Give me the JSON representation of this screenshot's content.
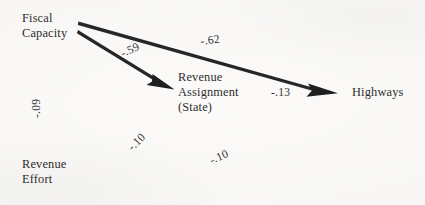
{
  "diagram": {
    "type": "path-diagram",
    "background_color": "#fbfaf8",
    "stroke_color": "#262626",
    "nodes": [
      {
        "id": "fiscal_capacity",
        "label_line1": "Fiscal",
        "label_line2": "Capacity"
      },
      {
        "id": "revenue_assignment",
        "label_line1": "Revenue",
        "label_line2": "Assignment",
        "label_line3": "(State)"
      },
      {
        "id": "highways",
        "label_line1": "Highways"
      },
      {
        "id": "revenue_effort",
        "label_line1": "Revenue",
        "label_line2": "Effort"
      }
    ],
    "coefficients": [
      {
        "id": "fiscal_to_highways",
        "value": "-.62"
      },
      {
        "id": "fiscal_to_revenue_assignment",
        "value": "-.59"
      },
      {
        "id": "revenue_assignment_to_highways",
        "value": "-.13"
      },
      {
        "id": "fiscal_to_revenue_effort",
        "value": "-.09"
      },
      {
        "id": "revenue_effort_to_revenue_assignment",
        "value": "-.10"
      },
      {
        "id": "revenue_effort_to_highways",
        "value": "-.10"
      }
    ],
    "arrows": [
      {
        "id": "arrow-fiscal-to-highways",
        "from": "fiscal_capacity",
        "to": "highways"
      },
      {
        "id": "arrow-fiscal-to-revenue-assignment",
        "from": "fiscal_capacity",
        "to": "revenue_assignment"
      }
    ]
  }
}
